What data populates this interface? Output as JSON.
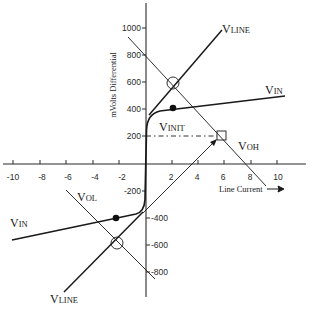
{
  "diagram": {
    "type": "line-characteristic",
    "axes": {
      "x": {
        "label": "Line Current",
        "arrow": "→",
        "ticks": [
          "-10",
          "-8",
          "-6",
          "-4",
          "-2",
          "2",
          "4",
          "6",
          "8",
          "10"
        ]
      },
      "y": {
        "label": "mVolts Differential",
        "ticks_positive": [
          "1000",
          "800",
          "600",
          "400",
          "200"
        ],
        "ticks_negative": [
          "-200",
          "-400",
          "-600",
          "-800"
        ]
      }
    },
    "labels": {
      "vline_top": {
        "main": "V",
        "sub": "LINE"
      },
      "vline_bottom": {
        "main": "V",
        "sub": "LINE"
      },
      "vin_right": {
        "main": "V",
        "sub": "IN"
      },
      "vin_left": {
        "main": "V",
        "sub": "IN"
      },
      "vinit": {
        "main": "V",
        "sub": "INIT"
      },
      "voh": {
        "main": "V",
        "sub": "OH"
      },
      "vol": {
        "main": "V",
        "sub": "OL"
      }
    },
    "markers": [
      {
        "name": "vline-voh-intersection",
        "shape": "circled-x",
        "x": 2,
        "y": 600
      },
      {
        "name": "vline-vol-intersection",
        "shape": "circled-x",
        "x": -2.2,
        "y": -600
      },
      {
        "name": "vin-operating-point-top",
        "shape": "filled-dot",
        "x": 2,
        "y": 420
      },
      {
        "name": "vin-operating-point-bottom",
        "shape": "filled-dot",
        "x": -2.2,
        "y": -410
      },
      {
        "name": "voh-point",
        "shape": "square-x",
        "x": 5.7,
        "y": 210
      }
    ],
    "colors": {
      "line": "#1a1a1a",
      "background": "#ffffff"
    }
  }
}
